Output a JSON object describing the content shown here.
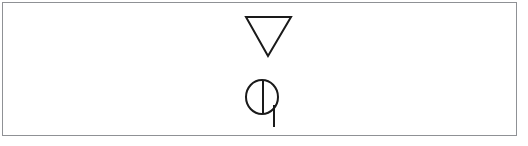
{
  "panel": {
    "background_color": "#ffffff",
    "border_color": "#8f9195",
    "ink_color": "#1a1a1a",
    "width": 528,
    "height": 146
  },
  "symbols": [
    {
      "id": "inverted-triangle",
      "name": "inverted-triangle-symbol",
      "description": "Open downward-pointing triangle (nabla / delete mark)",
      "stroke_color": "#1a1a1a",
      "stroke_width": 2,
      "filled": false,
      "geometry": {
        "top_left_x": 246,
        "top_right_x": 291,
        "top_y": 17,
        "apex_x": 268,
        "apex_y": 56
      },
      "label": ""
    },
    {
      "id": "split-circle-with-stem",
      "name": "split-circle-stem-symbol",
      "description": "Circle bisected by a vertical diameter line with a stem descending from the lower right of the arc",
      "stroke_color": "#1a1a1a",
      "stroke_width": 2,
      "filled": false,
      "geometry": {
        "center_x": 262,
        "center_y": 97,
        "radius_x": 16,
        "radius_y": 17,
        "diameter_line_x": 263,
        "diameter_top_y": 80,
        "diameter_bottom_y": 114,
        "stem_x": 274,
        "stem_top_y": 105,
        "stem_bottom_y": 127
      },
      "label": ""
    }
  ]
}
